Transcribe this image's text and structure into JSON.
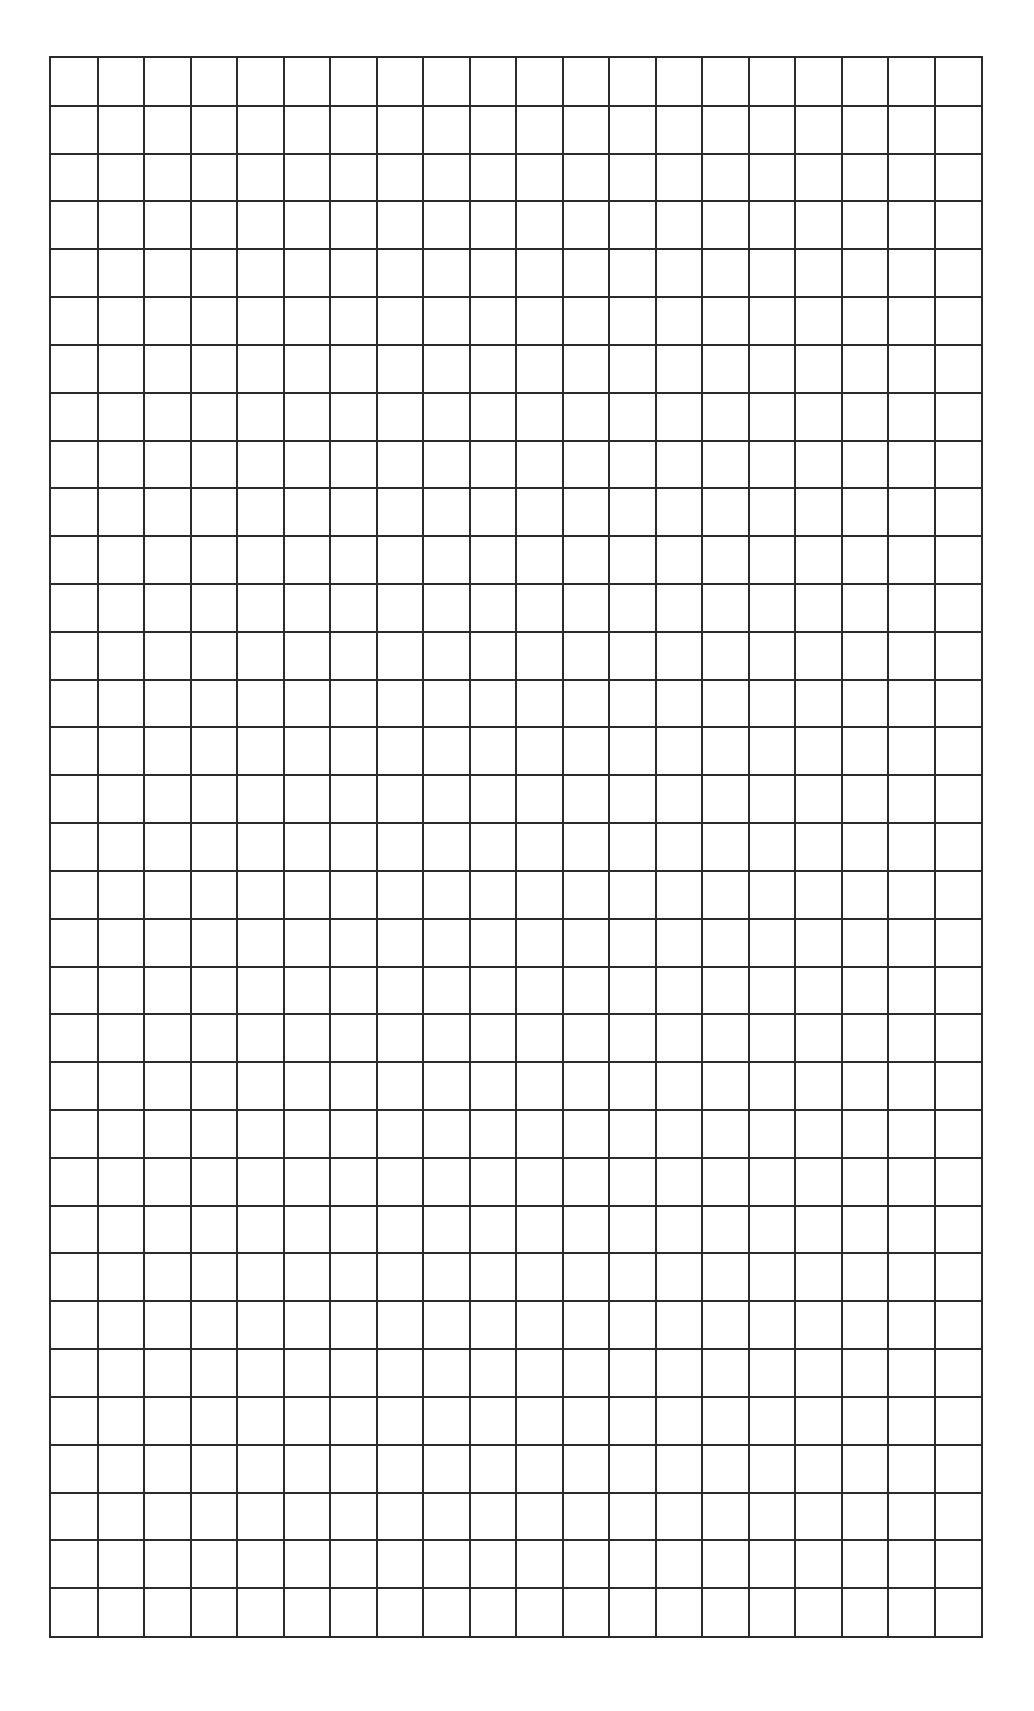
{
  "page": {
    "background_color": "#ffffff"
  },
  "grid": {
    "columns": 20,
    "rows": 33,
    "line_color": "#2b2b2b",
    "cell_width_px": 46.7,
    "cell_height_px": 47.9
  }
}
